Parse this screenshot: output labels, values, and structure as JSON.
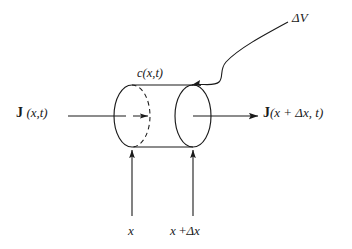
{
  "figure": {
    "background_color": "#ffffff",
    "stroke_color": "#1a1a1a"
  },
  "labels": {
    "flux_in": {
      "symbol": "J",
      "argument": "(x,t)",
      "name": "flux-in"
    },
    "flux_out": {
      "symbol": "J",
      "argument": "(x + Δx, t)",
      "name": "flux-out"
    },
    "concentration": "c(x,t)",
    "volume": "ΔV",
    "x_left": "x",
    "x_right_var": "x",
    "x_right_plus": " +",
    "x_right_delta": "Δx"
  },
  "geometry": {
    "cylinder": {
      "left_face_cx": 132,
      "right_face_cx": 193,
      "face_cy": 116,
      "face_rx": 18,
      "face_ry": 31,
      "top_y": 85,
      "bottom_y": 147
    },
    "inflow_arrow": {
      "x1": 68,
      "y1": 116,
      "x2": 124,
      "y2": 116
    },
    "inner_arrow": {
      "x1": 133,
      "y1": 116,
      "x2": 147,
      "y2": 116
    },
    "outflow_arrow": {
      "x1": 193,
      "y1": 116,
      "x2": 257,
      "y2": 116
    },
    "x_left_arrow": {
      "x": 132,
      "y1": 216,
      "y2": 149
    },
    "x_right_arrow": {
      "x": 193,
      "y1": 216,
      "y2": 149
    },
    "volume_pointer_start": {
      "x": 288,
      "y": 22
    },
    "volume_pointer_end": {
      "x": 189,
      "y": 84
    }
  }
}
